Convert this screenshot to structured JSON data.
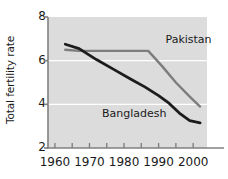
{
  "chart_data": {
    "type": "line",
    "title": "",
    "subtitle": "",
    "xlabel": "",
    "ylabel": "Total fertility rate",
    "xlim": [
      1958,
      2004
    ],
    "ylim": [
      2,
      8
    ],
    "xticks": [
      1960,
      1970,
      1980,
      1990,
      2000
    ],
    "xtick_labels": [
      "1960",
      "1970",
      "1980",
      "1990",
      "2000"
    ],
    "xminor_ticks": [
      1965,
      1975,
      1985,
      1995
    ],
    "yticks": [
      2,
      4,
      6,
      8
    ],
    "ytick_labels": [
      "2",
      "4",
      "6",
      "8"
    ],
    "grid": "horizontal-white-at-4-and-6",
    "legend_position": "inline-annotations",
    "plot_background": "#dcdcdc",
    "series": [
      {
        "name": "Pakistan",
        "color": "#7d7d7d",
        "label_x": 1992,
        "label_y": 6.95,
        "x": [
          1963,
          1967,
          1972,
          1977,
          1982,
          1987,
          1991,
          1995,
          1999,
          2002
        ],
        "values": [
          6.5,
          6.45,
          6.45,
          6.45,
          6.45,
          6.45,
          5.75,
          5.0,
          4.35,
          3.9
        ]
      },
      {
        "name": "Bangladesh",
        "color": "#1c1c1c",
        "label_x": 1980,
        "label_y": 3.55,
        "x": [
          1963,
          1967,
          1972,
          1977,
          1982,
          1986,
          1990,
          1993,
          1996,
          1999,
          2002
        ],
        "values": [
          6.75,
          6.55,
          6.05,
          5.6,
          5.15,
          4.8,
          4.4,
          4.05,
          3.6,
          3.25,
          3.15
        ]
      }
    ]
  }
}
